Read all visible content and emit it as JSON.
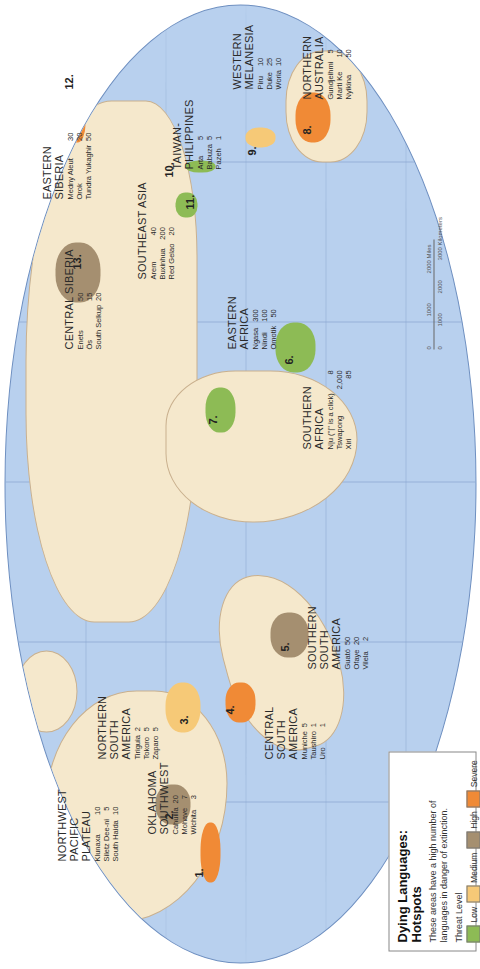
{
  "legend": {
    "title_line1": "Dying Languages:",
    "title_line2": "Hotspots",
    "description": "These areas have a high number of languages in danger of extinction.",
    "threat_label": "Threat Level",
    "levels": [
      {
        "label": "Low",
        "color": "#8dbb55"
      },
      {
        "label": "Medium",
        "color": "#f6c977"
      },
      {
        "label": "High",
        "color": "#a58f70"
      },
      {
        "label": "Severe",
        "color": "#f08a36"
      }
    ]
  },
  "hotspots": [
    {
      "num": "1.",
      "title": [
        "NORTHWEST",
        "PACIFIC",
        "PLATEAU"
      ],
      "level": "Severe",
      "languages": [
        {
          "name": "Klunaxa",
          "count": "10"
        },
        {
          "name": "Siletz Dee-ni",
          "count": "5"
        },
        {
          "name": "South Haida",
          "count": "10"
        }
      ]
    },
    {
      "num": "2.",
      "title": [
        "OKLAHOMA",
        "SOUTHWEST"
      ],
      "level": "High",
      "languages": [
        {
          "name": "Cahuilla",
          "count": "20"
        },
        {
          "name": "Mohave",
          "count": "7"
        },
        {
          "name": "Wichita",
          "count": "3"
        }
      ]
    },
    {
      "num": "3.",
      "title": [
        "NORTHERN",
        "SOUTH",
        "AMERICA"
      ],
      "level": "Medium",
      "languages": [
        {
          "name": "Tiriguia",
          "count": "2"
        },
        {
          "name": "Tokoro",
          "count": "5"
        },
        {
          "name": "Zaparo",
          "count": "5"
        }
      ]
    },
    {
      "num": "4.",
      "title": [
        "CENTRAL",
        "SOUTH",
        "AMERICA"
      ],
      "level": "Severe",
      "languages": [
        {
          "name": "Muniche",
          "count": "5"
        },
        {
          "name": "Taushiro",
          "count": "1"
        },
        {
          "name": "Uro",
          "count": "1"
        }
      ]
    },
    {
      "num": "5.",
      "title": [
        "SOUTHERN",
        "SOUTH",
        "AMERICA"
      ],
      "level": "High",
      "languages": [
        {
          "name": "Guató",
          "count": "50"
        },
        {
          "name": "Ofaye",
          "count": "20"
        },
        {
          "name": "Vilela",
          "count": "2"
        }
      ]
    },
    {
      "num": "6.",
      "title": [
        "SOUTHERN",
        "AFRICA"
      ],
      "level": "Low",
      "languages": [
        {
          "name": "N|u (\"|\" is a click)",
          "count": "8"
        },
        {
          "name": "Tswapong",
          "count": "2,000"
        },
        {
          "name": "Xiri",
          "count": "85"
        }
      ]
    },
    {
      "num": "7.",
      "title": [
        "EASTERN",
        "AFRICA"
      ],
      "level": "Low",
      "languages": [
        {
          "name": "Ngasa",
          "count": "300"
        },
        {
          "name": "Nindi",
          "count": "100"
        },
        {
          "name": "Omotik",
          "count": "50"
        }
      ]
    },
    {
      "num": "8.",
      "title": [
        "NORTHERN",
        "AUSTRALIA"
      ],
      "level": "Severe",
      "languages": [
        {
          "name": "Gundjeihmi",
          "count": "5"
        },
        {
          "name": "Marti Ke",
          "count": "10"
        },
        {
          "name": "Nyikina",
          "count": "50"
        }
      ]
    },
    {
      "num": "9.",
      "title": [
        "WESTERN",
        "MELANESIA"
      ],
      "level": "Medium",
      "languages": [
        {
          "name": "Piru",
          "count": "10"
        },
        {
          "name": "Duke",
          "count": "25"
        },
        {
          "name": "Woria",
          "count": "10"
        }
      ]
    },
    {
      "num": "10.",
      "title": [
        "TAIWAN-",
        "PHILIPPINES"
      ],
      "level": "Low",
      "languages": [
        {
          "name": "Arta",
          "count": "5"
        },
        {
          "name": "Babuza",
          "count": "5"
        },
        {
          "name": "Pazeh",
          "count": "1"
        }
      ]
    },
    {
      "num": "11.",
      "title": [
        "SOUTHEAST ASIA"
      ],
      "level": "Low",
      "languages": [
        {
          "name": "Arem",
          "count": "40"
        },
        {
          "name": "Buxinhua",
          "count": "200"
        },
        {
          "name": "Red Gelao",
          "count": "20"
        }
      ]
    },
    {
      "num": "12.",
      "title": [
        "EASTERN",
        "SIBERIA"
      ],
      "level": "Severe",
      "languages": [
        {
          "name": "Medny Aleut",
          "count": "30"
        },
        {
          "name": "Orok",
          "count": "20"
        },
        {
          "name": "Tundra Yukaghir",
          "count": "50"
        }
      ]
    },
    {
      "num": "13.",
      "title": [
        "CENTRAL SIBERIA"
      ],
      "level": "High",
      "languages": [
        {
          "name": "Enets",
          "count": "50"
        },
        {
          "name": "Ös",
          "count": "15"
        },
        {
          "name": "South Selkup",
          "count": "20"
        }
      ]
    }
  ],
  "scale": {
    "miles": [
      "0",
      "1000",
      "2000 Miles"
    ],
    "kilometers": [
      "0",
      "1000",
      "2000",
      "3000 Kilometers"
    ]
  }
}
